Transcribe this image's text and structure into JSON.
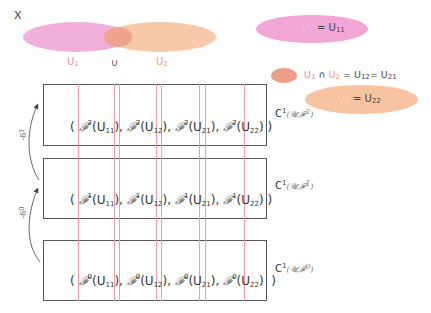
{
  "diagram": {
    "space_label": "X",
    "union": {
      "left_label": "U",
      "left_sub": "1",
      "operator": "∪",
      "right_label": "U",
      "right_sub": "2",
      "left_color": "#f2a6d8",
      "right_color": "#f7c3a0",
      "overlap_color": "#ee9f8a"
    },
    "legend": [
      {
        "lhs": "U",
        "lhs_sub": "1",
        "eq": "=",
        "rhs": "U",
        "rhs_sub": "11",
        "color": "#f2a6d8"
      },
      {
        "lhs": "U",
        "lhs_sub": "1",
        "op": "∩",
        "lhs2": "U",
        "lhs2_sub": "2",
        "eq": "=",
        "rhs": "U",
        "rhs_sub": "12",
        "eq2": "=",
        "rhs2": "U",
        "rhs2_sub": "21",
        "color": "#ee9f8a"
      },
      {
        "lhs": "U",
        "lhs_sub": "2",
        "eq": "=",
        "rhs": "U",
        "rhs_sub": "22",
        "color": "#f7c3a0"
      }
    ],
    "rows": [
      {
        "degree": "2",
        "sheaf": "𝓕",
        "terms": [
          "11",
          "12",
          "21",
          "22"
        ],
        "cochain": "C",
        "cochain_sup": "1",
        "cochain_arg": "(𝓤,𝓕",
        "cochain_arg_sup": "2",
        "cochain_close": ")"
      },
      {
        "degree": "1",
        "sheaf": "𝓕",
        "terms": [
          "11",
          "12",
          "21",
          "22"
        ],
        "cochain": "C",
        "cochain_sup": "1",
        "cochain_arg": "(𝓤,𝓕",
        "cochain_arg_sup": "1",
        "cochain_close": ")"
      },
      {
        "degree": "0",
        "sheaf": "𝓕",
        "terms": [
          "11",
          "12",
          "21",
          "22"
        ],
        "cochain": "C",
        "cochain_sup": "1",
        "cochain_arg": "(𝓤,𝓕",
        "cochain_arg_sup": "0",
        "cochain_close": ")"
      }
    ],
    "arrows": [
      {
        "label": "-δ",
        "sup": "1"
      },
      {
        "label": "-δ",
        "sup": "0"
      }
    ],
    "open_paren": "(",
    "close_paren": ")",
    "comma": ",",
    "grid_line_color": "#ef9ab0",
    "box_border_color": "#555555"
  }
}
